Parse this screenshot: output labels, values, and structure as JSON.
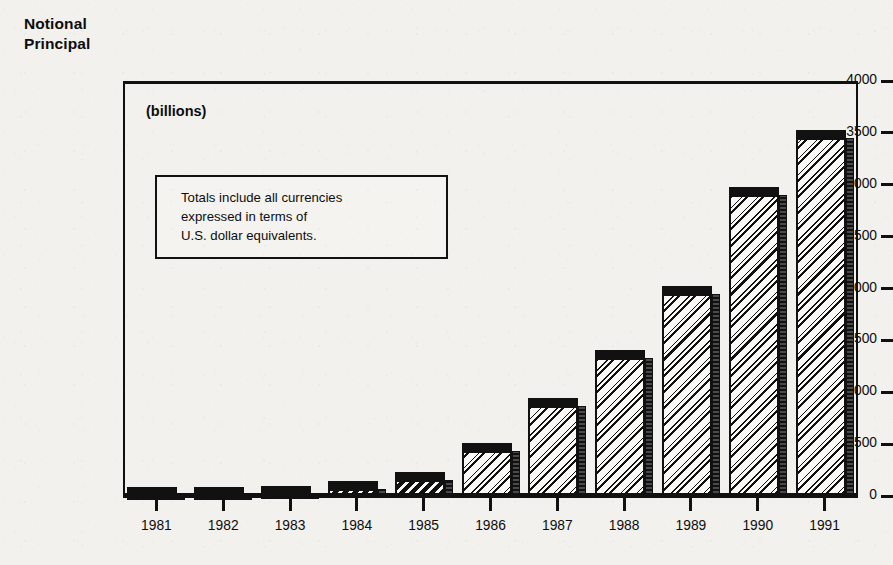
{
  "title": "Notional\nPrincipal",
  "units_caption": "(billions)",
  "note": "Totals include all currencies\nexpressed in terms of\nU.S. dollar equivalents.",
  "colors": {
    "ink": "#111111",
    "paper": "#f2f1ed",
    "bar_fill": "#fbfaf7"
  },
  "chart_data": {
    "type": "bar",
    "title": "Notional Principal",
    "subtitle": "(billions)",
    "xlabel": "",
    "ylabel": "Notional Principal",
    "unit": "billions of U.S. dollars",
    "annotation": "Totals include all currencies expressed in terms of U.S. dollar equivalents.",
    "categories": [
      "1981",
      "1982",
      "1983",
      "1984",
      "1985",
      "1986",
      "1987",
      "1988",
      "1989",
      "1990",
      "1991"
    ],
    "values": [
      5,
      10,
      20,
      70,
      150,
      430,
      870,
      1330,
      1950,
      2900,
      3450
    ],
    "ylim": [
      0,
      4000
    ],
    "yticks": [
      0,
      500,
      1000,
      1500,
      2000,
      2500,
      3000,
      3500,
      4000
    ],
    "ytick_labels": [
      "0",
      "500",
      "1000",
      "1500",
      "2000",
      "2500",
      "3000",
      "3500",
      "4000"
    ],
    "grid": false,
    "legend": "none",
    "style": "3d-shaded-hatched-bars"
  }
}
